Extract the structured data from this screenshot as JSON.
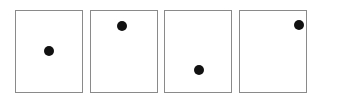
{
  "diagram": {
    "colors": {
      "border": "#8a8a8a",
      "dot": "#111111",
      "background": "#ffffff"
    },
    "panels": [
      {
        "index": 1,
        "left": 15,
        "dot": {
          "x": 49,
          "y": 51
        }
      },
      {
        "index": 2,
        "left": 90,
        "dot": {
          "x": 122,
          "y": 26
        }
      },
      {
        "index": 3,
        "left": 164,
        "dot": {
          "x": 199,
          "y": 70
        }
      },
      {
        "index": 4,
        "left": 239,
        "dot": {
          "x": 299,
          "y": 25
        }
      }
    ]
  }
}
